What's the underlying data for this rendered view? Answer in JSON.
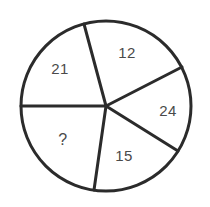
{
  "figure": {
    "kind": "pie-chart-puzzle",
    "background_color": "#ffffff",
    "stroke_color": "#2b2b2b",
    "label_color": "#4a4a4a",
    "stroke_width": 3,
    "center_x": 106,
    "center_y": 106,
    "radius": 85
  },
  "chart_data": {
    "type": "pie",
    "title": "",
    "subtitle": "",
    "xlabel": "",
    "ylabel": "",
    "grid": false,
    "legend": "none",
    "categories": [
      "12",
      "24",
      "15",
      "?",
      "21"
    ],
    "labels": [
      "12",
      "24",
      "15",
      "?",
      "21"
    ],
    "values": [
      12,
      24,
      15,
      null,
      21
    ],
    "annotations": [
      "?"
    ],
    "slices": [
      {
        "label": "12",
        "value": 12,
        "start_angle_deg": 27,
        "end_angle_deg": 105,
        "sweep_deg": 78,
        "label_x": 127,
        "label_y": 52
      },
      {
        "label": "24",
        "value": 24,
        "start_angle_deg": -32,
        "end_angle_deg": 27,
        "sweep_deg": 59,
        "label_x": 168,
        "label_y": 110
      },
      {
        "label": "15",
        "value": 15,
        "start_angle_deg": -98,
        "end_angle_deg": -32,
        "sweep_deg": 66,
        "label_x": 124,
        "label_y": 155
      },
      {
        "label": "?",
        "value": null,
        "start_angle_deg": 180,
        "end_angle_deg": 262,
        "sweep_deg": 82,
        "label_x": 63,
        "label_y": 140
      },
      {
        "label": "21",
        "value": 21,
        "start_angle_deg": 105,
        "end_angle_deg": 180,
        "sweep_deg": 75,
        "label_x": 60,
        "label_y": 68
      }
    ]
  },
  "dividers": [
    {
      "name": "divider-left-horizontal",
      "angle_deg": 180,
      "x2": 21,
      "y2": 106
    },
    {
      "name": "divider-21-12",
      "angle_deg": 105,
      "x2": 84,
      "y2": 24
    },
    {
      "name": "divider-12-24",
      "angle_deg": 27,
      "x2": 182,
      "y2": 67
    },
    {
      "name": "divider-24-15",
      "angle_deg": -32,
      "x2": 178,
      "y2": 151
    },
    {
      "name": "divider-15-unknown",
      "angle_deg": -98,
      "x2": 94,
      "y2": 190
    }
  ]
}
